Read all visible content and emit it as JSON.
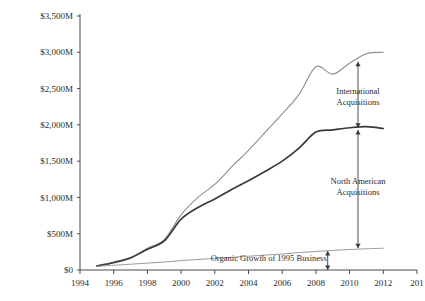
{
  "chart_data": {
    "type": "line",
    "title": "",
    "subtitle": "",
    "xlabel": "",
    "ylabel": "",
    "grid": false,
    "legend_position": "none",
    "xlim": [
      1994,
      2014
    ],
    "ylim": [
      0,
      3500
    ],
    "x_ticks": [
      1994,
      1996,
      1998,
      2000,
      2002,
      2004,
      2006,
      2008,
      2010,
      2012,
      2014
    ],
    "x_tick_labels": [
      "1994",
      "1996",
      "1998",
      "2000",
      "2002",
      "2004",
      "2006",
      "2008",
      "2010",
      "2012",
      "201"
    ],
    "y_ticks": [
      0,
      500,
      1000,
      1500,
      2000,
      2500,
      3000,
      3500
    ],
    "y_tick_labels": [
      "$0",
      "$500M",
      "$1,000M",
      "$1,500M",
      "$2,000M",
      "$2,500M",
      "$3,000M",
      "$3,500M"
    ],
    "x": [
      1995,
      1996,
      1997,
      1998,
      1999,
      2000,
      2001,
      2002,
      2003,
      2004,
      2005,
      2006,
      2007,
      2008,
      2009,
      2010,
      2011,
      2012
    ],
    "series": [
      {
        "name": "Total including International Acquisitions",
        "color": "#8e8e8e",
        "values": [
          60,
          110,
          175,
          300,
          420,
          760,
          1000,
          1180,
          1420,
          1650,
          1900,
          2150,
          2420,
          2800,
          2700,
          2850,
          2980,
          3000
        ]
      },
      {
        "name": "Total including North American Acquisitions",
        "color": "#3a3a3a",
        "values": [
          55,
          100,
          165,
          285,
          400,
          700,
          860,
          980,
          1110,
          1230,
          1360,
          1500,
          1680,
          1900,
          1930,
          1960,
          1975,
          1950
        ]
      },
      {
        "name": "Organic Growth of 1995 Business",
        "color": "#9b9b9b",
        "values": [
          50,
          65,
          80,
          95,
          110,
          130,
          145,
          160,
          175,
          190,
          205,
          220,
          240,
          255,
          270,
          282,
          292,
          300
        ]
      }
    ],
    "annotations": [
      {
        "name": "international-acquisitions",
        "lines": [
          "International",
          "Acquisitions"
        ],
        "x": 2010.5,
        "y_top": 2870,
        "y_bottom": 1960,
        "label_y": 2420
      },
      {
        "name": "north-american-acquisitions",
        "lines": [
          "North American",
          "Acquisitions"
        ],
        "x": 2010.5,
        "y_top": 1930,
        "y_bottom": 300,
        "label_y": 1180
      },
      {
        "name": "organic-growth",
        "lines": [
          "Organic Growth of 1995 Business"
        ],
        "x": 2008.7,
        "y_top": 262,
        "y_bottom": 0,
        "label_y": 120,
        "label_x": 2005.2,
        "label_anchor": "end"
      }
    ]
  }
}
